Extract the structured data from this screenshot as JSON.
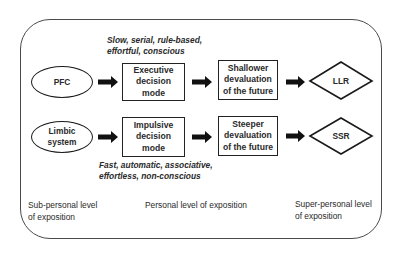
{
  "diagram": {
    "rows": [
      {
        "source": "PFC",
        "mode": [
          "Executive",
          "decision",
          "mode"
        ],
        "devaluation": [
          "Shallower",
          "devaluation",
          "of the future"
        ],
        "outcome": "LLR",
        "annotation": [
          "Slow, serial, rule-based,",
          "effortful, conscious"
        ]
      },
      {
        "source": [
          "Limbic",
          "system"
        ],
        "mode": [
          "Impulsive",
          "decision",
          "mode"
        ],
        "devaluation": [
          "Steeper",
          "devaluation",
          "of the future"
        ],
        "outcome": "SSR",
        "annotation": [
          "Fast, automatic, associative,",
          "effortless, non-conscious"
        ]
      }
    ],
    "levels": {
      "sub_personal": [
        "Sub-personal level",
        "of exposition"
      ],
      "personal": [
        "Personal level of exposition"
      ],
      "super_personal": [
        "Super-personal level",
        "of exposition"
      ]
    },
    "colors": {
      "stroke": "#1a1a1a",
      "frame": "#4a4a4a",
      "text": "#2a2a2a",
      "background": "#ffffff"
    }
  }
}
